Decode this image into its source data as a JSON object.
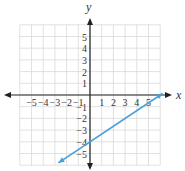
{
  "chart_data": {
    "type": "line",
    "title": "",
    "xlabel": "x",
    "ylabel": "y",
    "xlim": [
      -6,
      6
    ],
    "ylim": [
      -6,
      6
    ],
    "grid": true,
    "x_ticks": [
      -5,
      -4,
      -3,
      -2,
      -1,
      1,
      2,
      3,
      4,
      5
    ],
    "y_ticks": [
      -5,
      -4,
      -3,
      -2,
      -1,
      1,
      2,
      3,
      4,
      5
    ],
    "x_tick_labels": [
      "−5",
      "−4",
      "−3",
      "−2",
      "−1",
      "1",
      "2",
      "3",
      "4",
      "5"
    ],
    "y_tick_labels": [
      "−5",
      "−4",
      "−3",
      "−2",
      "−1",
      "1",
      "2",
      "3",
      "4",
      "5"
    ],
    "series": [
      {
        "name": "line",
        "equation": "y = (2/3)x − 4",
        "slope": 0.6667,
        "y_intercept": -4,
        "x_intercept": 6,
        "x": [
          -2.7,
          0,
          3,
          6.2
        ],
        "y": [
          -5.8,
          -4,
          -2,
          0.13
        ],
        "color": "#4a9fd8",
        "arrows": "both"
      }
    ]
  },
  "colors": {
    "grid": "#d9d9d9",
    "axis": "#222222",
    "line": "#4a9fd8"
  }
}
